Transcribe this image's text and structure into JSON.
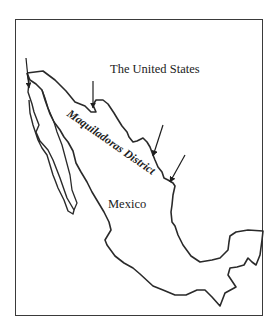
{
  "map": {
    "labels": {
      "country_north": "The United States",
      "country_south": "Mexico",
      "region": "Maquiladoras District"
    },
    "arrows": [
      {
        "name": "arrow-tijuana",
        "target": [
          4,
          68
        ]
      },
      {
        "name": "arrow-nogales",
        "target": [
          93,
          79
        ]
      },
      {
        "name": "arrow-juarez-east",
        "target": [
          152,
          153
        ]
      },
      {
        "name": "arrow-matamoros",
        "target": [
          170,
          180
        ]
      }
    ],
    "colors": {
      "outline": "#2a2a2a",
      "background": "#ffffff",
      "frame": "#3a3a3a"
    }
  }
}
